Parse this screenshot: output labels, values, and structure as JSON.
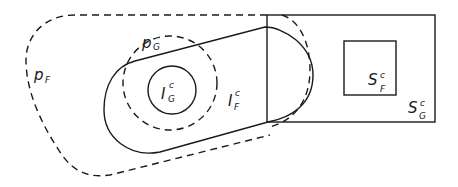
{
  "diagram": {
    "type": "set-relationship",
    "style": {
      "stroke_color": "#1a1a1a",
      "background": "#ffffff"
    },
    "labels": {
      "p_F": {
        "main": "p",
        "sub": "F"
      },
      "p_G": {
        "main": "p",
        "sub": "G"
      },
      "I_G_c": {
        "main": "I",
        "sub": "G",
        "sup": "c"
      },
      "I_F_c": {
        "main": "I",
        "sub": "F",
        "sup": "c"
      },
      "S_F_c": {
        "main": "S",
        "sub": "F",
        "sup": "c"
      },
      "S_G_c": {
        "main": "S",
        "sub": "G",
        "sup": "c"
      }
    },
    "shapes": [
      {
        "id": "p_F",
        "kind": "closed-curve",
        "line": "dashed"
      },
      {
        "id": "p_G",
        "kind": "circle",
        "line": "dashed"
      },
      {
        "id": "I_G_c",
        "kind": "circle",
        "line": "solid"
      },
      {
        "id": "I_F_c",
        "kind": "stadium",
        "line": "solid"
      },
      {
        "id": "I_F_c_offset",
        "kind": "stadium-offset",
        "line": "dashed"
      },
      {
        "id": "S_G_c",
        "kind": "rectangle",
        "line": "solid"
      },
      {
        "id": "S_F_c",
        "kind": "rectangle",
        "line": "solid"
      }
    ]
  }
}
